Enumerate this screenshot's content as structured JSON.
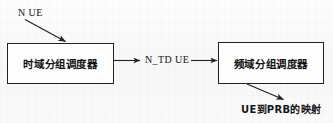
{
  "diagram": {
    "background_color": "#fbfbfb",
    "line_color": "#222222",
    "nodes": [
      {
        "id": "td",
        "label": "时域分组调度器"
      },
      {
        "id": "fd",
        "label": "频域分组调度器"
      }
    ],
    "labels": {
      "input": "N UE",
      "middle": "N_TD UE",
      "output": "UE到PRB的映射"
    },
    "connectors": [
      {
        "id": "input-arrow",
        "from": "N UE",
        "to": "时域分组调度器",
        "style": "diagonal-arrow"
      },
      {
        "id": "td-to-mid-arrow",
        "from": "时域分组调度器",
        "to": "N_TD UE",
        "style": "horizontal-arrow"
      },
      {
        "id": "mid-to-fd-arrow",
        "from": "N_TD UE",
        "to": "频域分组调度器",
        "style": "horizontal-arrow"
      },
      {
        "id": "output-arrow",
        "from": "频域分组调度器",
        "to": "UE到PRB的映射",
        "style": "diagonal-arrow"
      }
    ]
  }
}
